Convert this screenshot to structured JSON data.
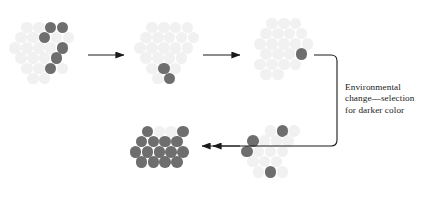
{
  "figure": {
    "width": 426,
    "height": 203,
    "background": "#ffffff"
  },
  "colors": {
    "light_circle": "#f1f1f1",
    "dark_circle": "#6e6e6e",
    "arrow": "#1a1a1a",
    "text": "#1a1a1a"
  },
  "geometry": {
    "circle_diameter": 11.6,
    "row_spacing": 10.2,
    "col_spacing": 11.8
  },
  "annotation": {
    "text": "Environmental\nchange—selection\nfor darker color",
    "lines": [
      "Environmental",
      "change—selection",
      "for darker color"
    ],
    "x": 345,
    "y": 82
  },
  "clusters": [
    {
      "id": "cluster-1",
      "name": "population-stage-1",
      "origin_x": 10,
      "origin_y": 22,
      "dark_count": 6,
      "light_count": 15,
      "circles": [
        {
          "cx": 27.0,
          "cy": 27.5,
          "shade": "light"
        },
        {
          "cx": 38.8,
          "cy": 27.5,
          "shade": "light"
        },
        {
          "cx": 50.6,
          "cy": 27.5,
          "shade": "dark"
        },
        {
          "cx": 62.4,
          "cy": 27.5,
          "shade": "dark"
        },
        {
          "cx": 21.1,
          "cy": 37.7,
          "shade": "light"
        },
        {
          "cx": 32.9,
          "cy": 37.7,
          "shade": "light"
        },
        {
          "cx": 44.7,
          "cy": 37.7,
          "shade": "dark"
        },
        {
          "cx": 56.5,
          "cy": 37.7,
          "shade": "light"
        },
        {
          "cx": 68.3,
          "cy": 37.7,
          "shade": "light"
        },
        {
          "cx": 15.2,
          "cy": 47.9,
          "shade": "light"
        },
        {
          "cx": 27.0,
          "cy": 47.9,
          "shade": "light"
        },
        {
          "cx": 38.8,
          "cy": 47.9,
          "shade": "light"
        },
        {
          "cx": 50.6,
          "cy": 47.9,
          "shade": "light"
        },
        {
          "cx": 62.4,
          "cy": 47.9,
          "shade": "dark"
        },
        {
          "cx": 21.1,
          "cy": 58.1,
          "shade": "light"
        },
        {
          "cx": 32.9,
          "cy": 58.1,
          "shade": "light"
        },
        {
          "cx": 44.7,
          "cy": 58.1,
          "shade": "light"
        },
        {
          "cx": 56.5,
          "cy": 58.1,
          "shade": "dark"
        },
        {
          "cx": 27.0,
          "cy": 68.3,
          "shade": "light"
        },
        {
          "cx": 38.8,
          "cy": 68.3,
          "shade": "light"
        },
        {
          "cx": 50.6,
          "cy": 68.3,
          "shade": "dark"
        },
        {
          "cx": 62.4,
          "cy": 68.3,
          "shade": "light"
        },
        {
          "cx": 32.9,
          "cy": 78.5,
          "shade": "light"
        },
        {
          "cx": 44.7,
          "cy": 78.5,
          "shade": "light"
        }
      ]
    },
    {
      "id": "cluster-2",
      "name": "population-stage-2",
      "origin_x": 135,
      "origin_y": 22,
      "dark_count": 2,
      "light_count": 19,
      "circles": [
        {
          "cx": 152.0,
          "cy": 27.5,
          "shade": "light"
        },
        {
          "cx": 163.8,
          "cy": 27.5,
          "shade": "light"
        },
        {
          "cx": 175.6,
          "cy": 27.5,
          "shade": "light"
        },
        {
          "cx": 187.4,
          "cy": 27.5,
          "shade": "light"
        },
        {
          "cx": 146.1,
          "cy": 37.7,
          "shade": "light"
        },
        {
          "cx": 157.9,
          "cy": 37.7,
          "shade": "light"
        },
        {
          "cx": 169.7,
          "cy": 37.7,
          "shade": "light"
        },
        {
          "cx": 181.5,
          "cy": 37.7,
          "shade": "light"
        },
        {
          "cx": 193.3,
          "cy": 37.7,
          "shade": "light"
        },
        {
          "cx": 140.2,
          "cy": 47.9,
          "shade": "light"
        },
        {
          "cx": 152.0,
          "cy": 47.9,
          "shade": "light"
        },
        {
          "cx": 163.8,
          "cy": 47.9,
          "shade": "light"
        },
        {
          "cx": 175.6,
          "cy": 47.9,
          "shade": "light"
        },
        {
          "cx": 187.4,
          "cy": 47.9,
          "shade": "light"
        },
        {
          "cx": 146.1,
          "cy": 58.1,
          "shade": "light"
        },
        {
          "cx": 157.9,
          "cy": 58.1,
          "shade": "light"
        },
        {
          "cx": 169.7,
          "cy": 58.1,
          "shade": "light"
        },
        {
          "cx": 181.5,
          "cy": 58.1,
          "shade": "light"
        },
        {
          "cx": 152.0,
          "cy": 68.3,
          "shade": "light"
        },
        {
          "cx": 163.8,
          "cy": 68.3,
          "shade": "dark"
        },
        {
          "cx": 175.6,
          "cy": 68.3,
          "shade": "light"
        },
        {
          "cx": 157.9,
          "cy": 78.5,
          "shade": "light"
        },
        {
          "cx": 169.7,
          "cy": 78.5,
          "shade": "dark"
        }
      ]
    },
    {
      "id": "cluster-3",
      "name": "population-stage-3",
      "origin_x": 252,
      "origin_y": 18,
      "dark_count": 1,
      "light_count": 20,
      "circles": [
        {
          "cx": 272.0,
          "cy": 23.5,
          "shade": "light"
        },
        {
          "cx": 283.8,
          "cy": 23.5,
          "shade": "light"
        },
        {
          "cx": 295.6,
          "cy": 23.5,
          "shade": "light"
        },
        {
          "cx": 266.1,
          "cy": 33.7,
          "shade": "light"
        },
        {
          "cx": 277.9,
          "cy": 33.7,
          "shade": "light"
        },
        {
          "cx": 289.7,
          "cy": 33.7,
          "shade": "light"
        },
        {
          "cx": 301.5,
          "cy": 33.7,
          "shade": "light"
        },
        {
          "cx": 260.2,
          "cy": 43.9,
          "shade": "light"
        },
        {
          "cx": 272.0,
          "cy": 43.9,
          "shade": "light"
        },
        {
          "cx": 283.8,
          "cy": 43.9,
          "shade": "light"
        },
        {
          "cx": 295.6,
          "cy": 43.9,
          "shade": "light"
        },
        {
          "cx": 307.4,
          "cy": 43.9,
          "shade": "light"
        },
        {
          "cx": 266.1,
          "cy": 54.1,
          "shade": "light"
        },
        {
          "cx": 277.9,
          "cy": 54.1,
          "shade": "light"
        },
        {
          "cx": 289.7,
          "cy": 54.1,
          "shade": "light"
        },
        {
          "cx": 301.5,
          "cy": 54.1,
          "shade": "dark"
        },
        {
          "cx": 260.2,
          "cy": 64.3,
          "shade": "light"
        },
        {
          "cx": 272.0,
          "cy": 64.3,
          "shade": "light"
        },
        {
          "cx": 283.8,
          "cy": 64.3,
          "shade": "light"
        },
        {
          "cx": 295.6,
          "cy": 64.3,
          "shade": "light"
        },
        {
          "cx": 266.1,
          "cy": 74.5,
          "shade": "light"
        },
        {
          "cx": 277.9,
          "cy": 74.5,
          "shade": "light"
        }
      ]
    },
    {
      "id": "cluster-4",
      "name": "population-stage-4",
      "origin_x": 240,
      "origin_y": 125,
      "dark_count": 4,
      "light_count": 13,
      "circles": [
        {
          "cx": 270.5,
          "cy": 131.0,
          "shade": "light"
        },
        {
          "cx": 282.3,
          "cy": 131.0,
          "shade": "dark"
        },
        {
          "cx": 294.1,
          "cy": 131.0,
          "shade": "light"
        },
        {
          "cx": 252.8,
          "cy": 141.2,
          "shade": "dark"
        },
        {
          "cx": 264.6,
          "cy": 141.2,
          "shade": "light"
        },
        {
          "cx": 276.4,
          "cy": 141.2,
          "shade": "light"
        },
        {
          "cx": 288.2,
          "cy": 141.2,
          "shade": "light"
        },
        {
          "cx": 246.9,
          "cy": 151.4,
          "shade": "dark"
        },
        {
          "cx": 258.7,
          "cy": 151.4,
          "shade": "light"
        },
        {
          "cx": 270.5,
          "cy": 151.4,
          "shade": "light"
        },
        {
          "cx": 282.3,
          "cy": 151.4,
          "shade": "light"
        },
        {
          "cx": 252.8,
          "cy": 161.6,
          "shade": "light"
        },
        {
          "cx": 264.6,
          "cy": 161.6,
          "shade": "light"
        },
        {
          "cx": 276.4,
          "cy": 161.6,
          "shade": "light"
        },
        {
          "cx": 258.7,
          "cy": 171.8,
          "shade": "light"
        },
        {
          "cx": 270.5,
          "cy": 171.8,
          "shade": "dark"
        },
        {
          "cx": 282.3,
          "cy": 171.8,
          "shade": "light"
        }
      ]
    },
    {
      "id": "cluster-5",
      "name": "population-stage-5",
      "origin_x": 120,
      "origin_y": 125,
      "dark_count": 12,
      "light_count": 2,
      "circles": [
        {
          "cx": 147.5,
          "cy": 131.5,
          "shade": "dark"
        },
        {
          "cx": 159.3,
          "cy": 131.5,
          "shade": "light"
        },
        {
          "cx": 171.1,
          "cy": 131.5,
          "shade": "light"
        },
        {
          "cx": 182.9,
          "cy": 131.5,
          "shade": "dark"
        },
        {
          "cx": 141.6,
          "cy": 141.7,
          "shade": "dark"
        },
        {
          "cx": 153.4,
          "cy": 141.7,
          "shade": "dark"
        },
        {
          "cx": 165.2,
          "cy": 141.7,
          "shade": "dark"
        },
        {
          "cx": 177.0,
          "cy": 141.7,
          "shade": "dark"
        },
        {
          "cx": 135.7,
          "cy": 151.9,
          "shade": "dark"
        },
        {
          "cx": 147.5,
          "cy": 151.9,
          "shade": "dark"
        },
        {
          "cx": 159.3,
          "cy": 151.9,
          "shade": "dark"
        },
        {
          "cx": 171.1,
          "cy": 151.9,
          "shade": "dark"
        },
        {
          "cx": 182.9,
          "cy": 151.9,
          "shade": "dark"
        },
        {
          "cx": 141.6,
          "cy": 162.1,
          "shade": "dark"
        },
        {
          "cx": 153.4,
          "cy": 162.1,
          "shade": "dark"
        },
        {
          "cx": 165.2,
          "cy": 162.1,
          "shade": "dark"
        },
        {
          "cx": 177.0,
          "cy": 162.1,
          "shade": "dark"
        }
      ]
    }
  ],
  "arrows": [
    {
      "id": "arrow-1",
      "name": "arrow-stage1-to-stage2",
      "type": "straight",
      "x1": 88,
      "y1": 55,
      "x2": 124,
      "y2": 55,
      "direction": "right"
    },
    {
      "id": "arrow-2",
      "name": "arrow-stage2-to-stage3",
      "type": "straight",
      "x1": 203,
      "y1": 55,
      "x2": 240,
      "y2": 55,
      "direction": "right"
    },
    {
      "id": "arrow-3",
      "name": "arrow-stage3-to-stage4-curved",
      "type": "curved",
      "path": "M 314 55 L 331 55 Q 337 55 337 61 L 337 140 Q 337 146 331 146 L 213 146",
      "direction": "left-down"
    },
    {
      "id": "arrow-4",
      "name": "arrow-stage4-to-stage5",
      "type": "straight",
      "x1": 240,
      "y1": 146,
      "x2": 202,
      "y2": 146,
      "direction": "left"
    }
  ]
}
